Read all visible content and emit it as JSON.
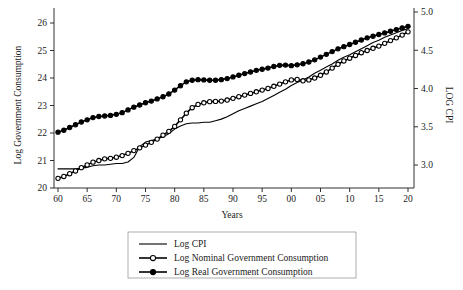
{
  "chart_data": {
    "type": "line",
    "title": "",
    "xlabel": "Years",
    "ylabel": "Log Government Consumption",
    "y2label": "LOG CPI",
    "grid": false,
    "legend_position": "bottom-center",
    "xlim": [
      1960,
      2020
    ],
    "ylim": [
      20,
      26.4
    ],
    "y2lim": [
      2.7,
      5.0
    ],
    "xticks": [
      1960,
      1965,
      1970,
      1975,
      1980,
      1985,
      1990,
      1995,
      2000,
      2005,
      2010,
      2015,
      2020
    ],
    "xtick_labels": [
      "60",
      "65",
      "70",
      "75",
      "80",
      "85",
      "90",
      "95",
      "00",
      "05",
      "10",
      "15",
      "20"
    ],
    "yticks": [
      20,
      21,
      22,
      23,
      24,
      25,
      26
    ],
    "ytick_labels": [
      "20",
      "21",
      "22",
      "23",
      "24",
      "25",
      "26"
    ],
    "y2ticks": [
      3.0,
      3.5,
      4.0,
      4.5,
      5.0
    ],
    "y2tick_labels": [
      "3.0",
      "3.5",
      "4.0",
      "4.5",
      "5.0"
    ],
    "x": [
      1960,
      1961,
      1962,
      1963,
      1964,
      1965,
      1966,
      1967,
      1968,
      1969,
      1970,
      1971,
      1972,
      1973,
      1974,
      1975,
      1976,
      1977,
      1978,
      1979,
      1980,
      1981,
      1982,
      1983,
      1984,
      1985,
      1986,
      1987,
      1988,
      1989,
      1990,
      1991,
      1992,
      1993,
      1994,
      1995,
      1996,
      1997,
      1998,
      1999,
      2000,
      2001,
      2002,
      2003,
      2004,
      2005,
      2006,
      2007,
      2008,
      2009,
      2010,
      2011,
      2012,
      2013,
      2014,
      2015,
      2016,
      2017,
      2018,
      2019,
      2020
    ],
    "series": [
      {
        "name": "Log CPI",
        "axis": "right",
        "marker": "none",
        "values": [
          2.95,
          2.95,
          2.95,
          2.95,
          2.96,
          2.97,
          2.99,
          3.0,
          3.0,
          3.01,
          3.02,
          3.02,
          3.04,
          3.1,
          3.24,
          3.3,
          3.32,
          3.34,
          3.37,
          3.41,
          3.47,
          3.51,
          3.54,
          3.55,
          3.55,
          3.56,
          3.56,
          3.58,
          3.6,
          3.63,
          3.67,
          3.71,
          3.74,
          3.77,
          3.8,
          3.83,
          3.87,
          3.91,
          3.95,
          3.99,
          4.04,
          4.08,
          4.11,
          4.15,
          4.2,
          4.24,
          4.28,
          4.32,
          4.37,
          4.41,
          4.44,
          4.48,
          4.52,
          4.56,
          4.6,
          4.63,
          4.67,
          4.7,
          4.73,
          4.76,
          4.78
        ]
      },
      {
        "name": "Log Nominal Government Consumption",
        "axis": "left",
        "marker": "open-circle",
        "values": [
          20.35,
          20.42,
          20.52,
          20.62,
          20.74,
          20.84,
          20.94,
          21.0,
          21.06,
          21.08,
          21.12,
          21.18,
          21.26,
          21.36,
          21.46,
          21.56,
          21.66,
          21.78,
          21.92,
          22.06,
          22.24,
          22.48,
          22.72,
          22.92,
          23.04,
          23.1,
          23.14,
          23.15,
          23.16,
          23.2,
          23.26,
          23.32,
          23.38,
          23.44,
          23.5,
          23.56,
          23.62,
          23.7,
          23.78,
          23.86,
          23.93,
          23.95,
          23.9,
          23.93,
          24.0,
          24.1,
          24.22,
          24.36,
          24.5,
          24.62,
          24.72,
          24.82,
          24.92,
          25.0,
          25.08,
          25.16,
          25.26,
          25.36,
          25.46,
          25.56,
          25.68
        ]
      },
      {
        "name": "Log Real Government Consumption",
        "axis": "left",
        "marker": "filled-circle",
        "values": [
          22.03,
          22.1,
          22.2,
          22.3,
          22.4,
          22.48,
          22.56,
          22.6,
          22.62,
          22.64,
          22.68,
          22.74,
          22.84,
          22.94,
          23.02,
          23.1,
          23.16,
          23.24,
          23.32,
          23.42,
          23.56,
          23.72,
          23.86,
          23.92,
          23.94,
          23.93,
          23.92,
          23.92,
          23.94,
          23.98,
          24.04,
          24.1,
          24.16,
          24.22,
          24.28,
          24.32,
          24.36,
          24.42,
          24.46,
          24.47,
          24.45,
          24.48,
          24.52,
          24.58,
          24.66,
          24.76,
          24.86,
          24.96,
          25.06,
          25.14,
          25.22,
          25.3,
          25.38,
          25.46,
          25.52,
          25.58,
          25.64,
          25.7,
          25.76,
          25.82,
          25.88
        ]
      }
    ]
  },
  "legend": {
    "items": [
      {
        "label": "Log CPI",
        "marker": "none"
      },
      {
        "label": "Log Nominal Government Consumption",
        "marker": "open-circle"
      },
      {
        "label": "Log Real Government Consumption",
        "marker": "filled-circle"
      }
    ]
  },
  "colors": {
    "line": "#000000",
    "text": "#1a1a1a",
    "legend_border": "#8a8a8a",
    "background": "#ffffff"
  }
}
